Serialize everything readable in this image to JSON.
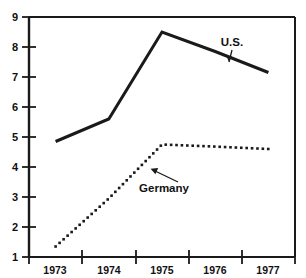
{
  "chart_data": {
    "type": "line",
    "title": "",
    "subtitle": "",
    "xlabel": "",
    "ylabel": "",
    "x": [
      "1973",
      "1974",
      "1975",
      "1976",
      "1977"
    ],
    "categories": [
      "1973",
      "1974",
      "1975",
      "1976",
      "1977"
    ],
    "xlim": [
      1972.5,
      1977.5
    ],
    "ylim": [
      1,
      9
    ],
    "ytick_labels": [
      "9",
      "8",
      "7",
      "6",
      "5",
      "4",
      "3",
      "2",
      "1"
    ],
    "ytick_values": [
      9,
      8,
      7,
      6,
      5,
      4,
      3,
      2,
      1
    ],
    "xtick_labels": [
      "1973",
      "1974",
      "1975",
      "1976",
      "1977"
    ],
    "grid": false,
    "frame": "box",
    "legend_position": "inline-annotation",
    "series": [
      {
        "name": "U.S.",
        "style": "solid",
        "color": "#1a1a1a",
        "linewidth": 3,
        "values": [
          4.85,
          5.6,
          8.5,
          7.85,
          7.15
        ]
      },
      {
        "name": "Germany",
        "style": "dotted",
        "color": "#1a1a1a",
        "linewidth": 3,
        "values": [
          1.35,
          2.95,
          4.75,
          4.68,
          4.6
        ]
      }
    ],
    "annotations": [
      {
        "text": "U.S.",
        "series": "U.S.",
        "points_to": "curve-right-segment"
      },
      {
        "text": "Germany",
        "series": "Germany",
        "points_to": "curve-rise-segment"
      }
    ]
  },
  "axes": {
    "y_axis_name": "y-axis",
    "x_axis_name": "x-axis"
  }
}
